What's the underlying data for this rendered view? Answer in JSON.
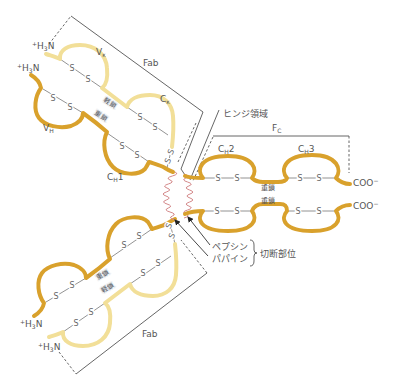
{
  "colors": {
    "background": "#ffffff",
    "heavy_chain": "#d9a12c",
    "light_chain": "#f2df98",
    "hinge": "#d4898a",
    "line": "#555555",
    "text": "#555555"
  },
  "symbols": {
    "disulfide": "S"
  },
  "upper_fab": {
    "bracket_label": "Fab",
    "light_n_terminus": {
      "charge": "+",
      "h": "H",
      "sub": "3",
      "n": "N"
    },
    "heavy_n_terminus": {
      "charge": "+",
      "h": "H",
      "sub": "3",
      "n": "N"
    },
    "light_chain_label": "軽鎖",
    "heavy_chain_label": "重鎖",
    "domains": {
      "vl": {
        "main": "V",
        "sub": "κ"
      },
      "cl": {
        "main": "C",
        "sub": "κ"
      },
      "vh": {
        "main": "V",
        "sub": "H"
      },
      "ch1": {
        "main": "C",
        "sub": "H",
        "suffix": "1"
      }
    }
  },
  "lower_fab": {
    "bracket_label": "Fab",
    "heavy_n_terminus": {
      "charge": "+",
      "h": "H",
      "sub": "3",
      "n": "N"
    },
    "light_n_terminus": {
      "charge": "+",
      "h": "H",
      "sub": "3",
      "n": "N"
    },
    "heavy_chain_label": "重鎖",
    "light_chain_label": "軽鎖"
  },
  "hinge": {
    "label": "ヒンジ領域"
  },
  "fc": {
    "bracket_label": {
      "main": "F",
      "sub": "C"
    },
    "domains": {
      "ch2": {
        "main": "C",
        "sub": "H",
        "suffix": "2"
      },
      "ch3": {
        "main": "C",
        "sub": "H",
        "suffix": "3"
      }
    },
    "upper_heavy_chain_label": "重鎖",
    "lower_heavy_chain_label": "重鎖",
    "c_terminus": {
      "text": "COO",
      "charge": "−"
    }
  },
  "cleavage": {
    "enzymes": [
      "ペプシン",
      "パパイン"
    ],
    "label": "切断部位"
  }
}
